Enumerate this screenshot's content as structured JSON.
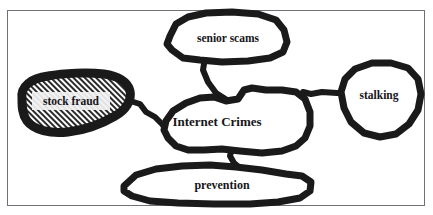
{
  "diagram": {
    "type": "concept-map",
    "background_color": "#ffffff",
    "frame_color": "#6f7278",
    "ink_color": "#1a1a1a",
    "nodes": [
      {
        "id": "internet-crimes",
        "label": "Internet Crimes",
        "role": "central-concept",
        "font_size": 13,
        "fill": "none",
        "center_x": 215,
        "center_y": 122
      },
      {
        "id": "senior-scams",
        "label": "senior scams",
        "role": "sub-concept",
        "font_size": 11.5,
        "fill": "none",
        "center_x": 228,
        "center_y": 39
      },
      {
        "id": "stock-fraud",
        "label": "stock fraud",
        "role": "sub-concept",
        "font_size": 11.5,
        "fill": "diagonal-hatch",
        "center_x": 71,
        "center_y": 101
      },
      {
        "id": "stalking",
        "label": "stalking",
        "role": "sub-concept",
        "font_size": 11.5,
        "fill": "none",
        "center_x": 376,
        "center_y": 96
      },
      {
        "id": "prevention",
        "label": "prevention",
        "role": "sub-concept",
        "font_size": 12,
        "fill": "none",
        "center_x": 222,
        "center_y": 185
      }
    ],
    "edges": [
      {
        "from": "senior-scams",
        "to": "internet-crimes"
      },
      {
        "from": "stock-fraud",
        "to": "internet-crimes"
      },
      {
        "from": "stalking",
        "to": "internet-crimes"
      },
      {
        "from": "prevention",
        "to": "internet-crimes"
      }
    ]
  }
}
